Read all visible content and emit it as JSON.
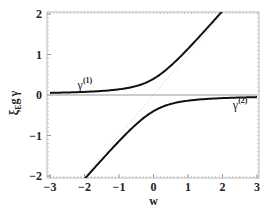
{
  "chart_data": {
    "type": "line",
    "title": "",
    "xlabel": "w",
    "ylabel": "ξ_E g γ",
    "ylabel_parts": {
      "main": "ξ",
      "sub": "E",
      "mid": "g",
      "tail": "γ"
    },
    "xlim": [
      -3,
      3
    ],
    "ylim": [
      -2,
      2
    ],
    "xticks": [
      -3,
      -2,
      -1,
      0,
      1,
      2,
      3
    ],
    "xtick_labels": [
      "−3",
      "−2",
      "−1",
      "0",
      "1",
      "2",
      "3"
    ],
    "yticks": [
      -2,
      -1,
      0,
      1,
      2
    ],
    "ytick_labels": [
      "−2",
      "−1",
      "0",
      "1",
      "2"
    ],
    "grid": false,
    "formula": "γ = (w ± sqrt(w² + 4·0.4²)) / 2",
    "series": [
      {
        "name": "γ(1)",
        "label_main": "γ",
        "label_sup": "(1)",
        "color": "#111111",
        "style": "solid",
        "x": [
          -3,
          -2.5,
          -2,
          -1.5,
          -1,
          -0.5,
          0,
          0.5,
          1,
          1.5,
          2
        ],
        "y": [
          0.05,
          0.06,
          0.08,
          0.1,
          0.14,
          0.22,
          0.4,
          0.72,
          1.14,
          1.6,
          2.08
        ]
      },
      {
        "name": "γ(2)",
        "label_main": "γ",
        "label_sup": "(2)",
        "color": "#111111",
        "style": "solid",
        "x": [
          -2,
          -1.5,
          -1,
          -0.5,
          0,
          0.5,
          1,
          1.5,
          2,
          2.5,
          3
        ],
        "y": [
          -2.08,
          -1.6,
          -1.14,
          -0.72,
          -0.4,
          -0.22,
          -0.14,
          -0.1,
          -0.08,
          -0.06,
          -0.05
        ]
      },
      {
        "name": "asymptote y=w",
        "color": "#bbbbbb",
        "style": "dotted",
        "x": [
          -2,
          2
        ],
        "y": [
          -2,
          2
        ]
      },
      {
        "name": "zero line",
        "color": "#999999",
        "style": "solid",
        "x": [
          -3,
          3
        ],
        "y": [
          0,
          0
        ]
      }
    ],
    "annotations": [
      {
        "text": "γ(1)",
        "at_series": "γ(1)",
        "x": -2.2,
        "y": 0.15
      },
      {
        "text": "γ(2)",
        "at_series": "γ(2)",
        "x": 2.3,
        "y": -0.35
      }
    ]
  }
}
